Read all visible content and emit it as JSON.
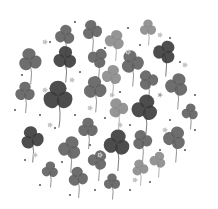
{
  "image": {
    "description": "Grayscale watercolor illustration of three-leaf clovers arranged in a circular cluster with small dots and tiny flowers",
    "width": 218,
    "height": 209,
    "background": "#ffffff",
    "shades": {
      "dark": "#3a3a3a",
      "mid": "#5e5e5e",
      "light": "#8a8a8a",
      "pale": "#c8c8c8"
    },
    "clovers": [
      {
        "x": 65,
        "y": 35,
        "r": 6,
        "shade": "mid",
        "rot": 10
      },
      {
        "x": 92,
        "y": 30,
        "r": 6,
        "shade": "mid",
        "rot": -15
      },
      {
        "x": 115,
        "y": 40,
        "r": 6,
        "shade": "light",
        "rot": 20
      },
      {
        "x": 148,
        "y": 28,
        "r": 5,
        "shade": "light",
        "rot": 0
      },
      {
        "x": 165,
        "y": 52,
        "r": 7,
        "shade": "dark",
        "rot": 30
      },
      {
        "x": 30,
        "y": 60,
        "r": 7,
        "shade": "mid",
        "rot": -10
      },
      {
        "x": 65,
        "y": 58,
        "r": 7,
        "shade": "dark",
        "rot": 5
      },
      {
        "x": 98,
        "y": 58,
        "r": 6,
        "shade": "mid",
        "rot": 40
      },
      {
        "x": 132,
        "y": 62,
        "r": 7,
        "shade": "mid",
        "rot": -20
      },
      {
        "x": 112,
        "y": 75,
        "r": 6,
        "shade": "light",
        "rot": 15
      },
      {
        "x": 148,
        "y": 80,
        "r": 6,
        "shade": "mid",
        "rot": -30
      },
      {
        "x": 177,
        "y": 85,
        "r": 7,
        "shade": "mid",
        "rot": 20
      },
      {
        "x": 25,
        "y": 92,
        "r": 6,
        "shade": "mid",
        "rot": 0
      },
      {
        "x": 58,
        "y": 96,
        "r": 9,
        "shade": "dark",
        "rot": 0
      },
      {
        "x": 95,
        "y": 88,
        "r": 7,
        "shade": "mid",
        "rot": -5
      },
      {
        "x": 145,
        "y": 108,
        "r": 8,
        "shade": "dark",
        "rot": 15
      },
      {
        "x": 118,
        "y": 108,
        "r": 6,
        "shade": "light",
        "rot": -25
      },
      {
        "x": 190,
        "y": 112,
        "r": 5,
        "shade": "mid",
        "rot": 10
      },
      {
        "x": 32,
        "y": 138,
        "r": 7,
        "shade": "dark",
        "rot": -15
      },
      {
        "x": 70,
        "y": 148,
        "r": 7,
        "shade": "mid",
        "rot": 20
      },
      {
        "x": 88,
        "y": 128,
        "r": 6,
        "shade": "mid",
        "rot": 0
      },
      {
        "x": 117,
        "y": 143,
        "r": 8,
        "shade": "dark",
        "rot": 10
      },
      {
        "x": 142,
        "y": 140,
        "r": 6,
        "shade": "mid",
        "rot": -20
      },
      {
        "x": 175,
        "y": 138,
        "r": 7,
        "shade": "mid",
        "rot": 25
      },
      {
        "x": 50,
        "y": 170,
        "r": 5,
        "shade": "mid",
        "rot": 5
      },
      {
        "x": 78,
        "y": 177,
        "r": 6,
        "shade": "mid",
        "rot": -10
      },
      {
        "x": 98,
        "y": 160,
        "r": 6,
        "shade": "mid",
        "rot": 30
      },
      {
        "x": 112,
        "y": 182,
        "r": 5,
        "shade": "mid",
        "rot": 0
      },
      {
        "x": 140,
        "y": 168,
        "r": 5,
        "shade": "light",
        "rot": -15
      },
      {
        "x": 158,
        "y": 160,
        "r": 5,
        "shade": "light",
        "rot": 20
      }
    ],
    "dots": [
      [
        75,
        22
      ],
      [
        128,
        28
      ],
      [
        170,
        38
      ],
      [
        50,
        42
      ],
      [
        105,
        48
      ],
      [
        140,
        45
      ],
      [
        180,
        62
      ],
      [
        22,
        75
      ],
      [
        80,
        72
      ],
      [
        120,
        92
      ],
      [
        160,
        95
      ],
      [
        195,
        95
      ],
      [
        40,
        115
      ],
      [
        75,
        115
      ],
      [
        105,
        118
      ],
      [
        170,
        120
      ],
      [
        15,
        110
      ],
      [
        55,
        128
      ],
      [
        130,
        125
      ],
      [
        195,
        130
      ],
      [
        25,
        160
      ],
      [
        62,
        162
      ],
      [
        90,
        145
      ],
      [
        160,
        150
      ],
      [
        185,
        150
      ],
      [
        40,
        185
      ],
      [
        95,
        190
      ],
      [
        130,
        190
      ],
      [
        150,
        182
      ],
      [
        70,
        195
      ]
    ],
    "flowers": [
      [
        45,
        42
      ],
      [
        160,
        35
      ],
      [
        45,
        90
      ],
      [
        72,
        80
      ],
      [
        112,
        95
      ],
      [
        160,
        95
      ],
      [
        185,
        65
      ],
      [
        50,
        125
      ],
      [
        120,
        125
      ],
      [
        100,
        155
      ],
      [
        135,
        180
      ],
      [
        35,
        155
      ],
      [
        165,
        130
      ],
      [
        128,
        52
      ],
      [
        90,
        108
      ]
    ]
  }
}
